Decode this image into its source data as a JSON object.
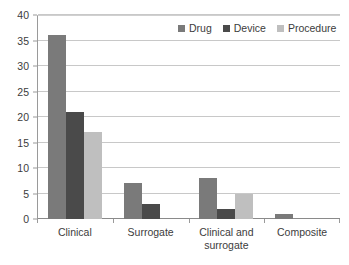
{
  "chart_data": {
    "type": "bar",
    "title": "",
    "subtitle": "",
    "xlabel": "",
    "ylabel": "",
    "ylim": [
      0,
      40
    ],
    "y_ticks": [
      0,
      5,
      10,
      15,
      20,
      25,
      30,
      35,
      40
    ],
    "grid": "horizontal",
    "legend_position": "top-right",
    "orientation": "vertical",
    "grouping": "clustered",
    "categories": [
      "Clinical",
      "Surrogate",
      "Clinical and\nsurrogate",
      "Composite"
    ],
    "series": [
      {
        "name": "Drug",
        "color": "#7a7a7a",
        "values": [
          36,
          7,
          8,
          1
        ]
      },
      {
        "name": "Device",
        "color": "#4a4a4a",
        "values": [
          21,
          3,
          2,
          0
        ]
      },
      {
        "name": "Procedure",
        "color": "#bfbfbf",
        "values": [
          17,
          0,
          5,
          0
        ]
      }
    ]
  },
  "legend": {
    "entries": [
      {
        "label": "Drug"
      },
      {
        "label": "Device"
      },
      {
        "label": "Procedure"
      }
    ]
  },
  "axes": {
    "y": {
      "ticks": [
        "0",
        "5",
        "10",
        "15",
        "20",
        "25",
        "30",
        "35",
        "40"
      ],
      "min": 0,
      "max": 40
    },
    "x": {
      "ticks": [
        "Clinical",
        "Surrogate",
        "Clinical and\nsurrogate",
        "Composite"
      ]
    }
  },
  "colors": {
    "drug": "#7a7a7a",
    "device": "#4a4a4a",
    "procedure": "#bfbfbf",
    "gridline": "#c8c8c8",
    "axis": "#9a9a9a",
    "text": "#3c3c3c",
    "background": "#ffffff"
  }
}
